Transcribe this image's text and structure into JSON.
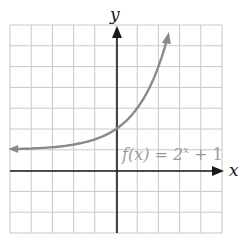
{
  "chart_data": {
    "type": "line",
    "title": "",
    "xlabel": "x",
    "ylabel": "y",
    "xlim": [
      -5,
      5
    ],
    "ylim": [
      -3,
      7
    ],
    "grid": true,
    "series": [
      {
        "name": "f(x) = 2^x + 1",
        "color": "#8a8a8a",
        "x": [
          -5,
          -4,
          -3,
          -2,
          -1,
          0,
          1,
          2,
          2.4
        ],
        "y": [
          1.03,
          1.06,
          1.13,
          1.25,
          1.5,
          2,
          3,
          5,
          6.3
        ]
      }
    ],
    "annotations": [
      {
        "text_func": "f(x) = 2",
        "text_exp": "x",
        "text_tail": " + 1",
        "x": 1.5,
        "y": 1
      }
    ]
  },
  "labels": {
    "x_axis": "x",
    "y_axis": "y",
    "func_prefix": "f(x) = 2",
    "func_exp": "x",
    "func_suffix": " + 1"
  },
  "colors": {
    "grid": "#c8c8c8",
    "axis": "#1a1a1a",
    "curve": "#8a8a8a",
    "label": "#9a9a9a"
  }
}
